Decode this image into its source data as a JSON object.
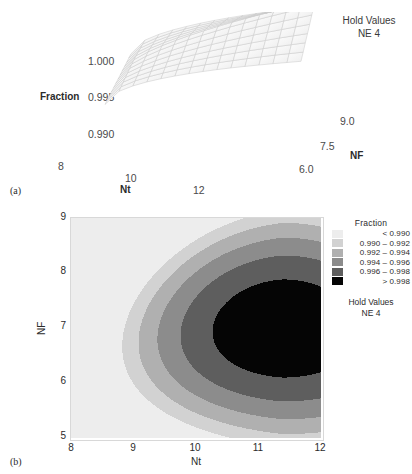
{
  "figure": {
    "panel_a_letter": "(a)",
    "panel_b_letter": "(b)"
  },
  "surface_plot": {
    "z_axis": {
      "title": "Fraction",
      "ticks": [
        "1.000",
        "0.995",
        "0.990"
      ]
    },
    "x_axis": {
      "title": "Nt",
      "ticks": [
        "8",
        "10",
        "12"
      ]
    },
    "y_axis": {
      "title": "NF",
      "ticks": [
        "9.0",
        "7.5",
        "6.0"
      ]
    },
    "hold_values": {
      "heading": "Hold Values",
      "value": "NE 4"
    }
  },
  "contour_plot": {
    "x_axis": {
      "title": "Nt",
      "ticks": [
        "8",
        "9",
        "10",
        "11",
        "12"
      ]
    },
    "y_axis": {
      "title": "NF",
      "ticks": [
        "9",
        "8",
        "7",
        "6",
        "5"
      ]
    },
    "legend": {
      "title": "Fraction",
      "entries": [
        {
          "label": "<  0.990",
          "color": "#ededed"
        },
        {
          "label": "0.990  –  0.992",
          "color": "#d2d2d2"
        },
        {
          "label": "0.992  –  0.994",
          "color": "#b0b0b0"
        },
        {
          "label": "0.994  –  0.996",
          "color": "#8c8c8c"
        },
        {
          "label": "0.996  –  0.998",
          "color": "#5e5e5e"
        },
        {
          "label": ">  0.998",
          "color": "#050505"
        }
      ]
    },
    "hold_values": {
      "heading": "Hold Values",
      "value": "NE 4"
    }
  },
  "chart_data": [
    {
      "type": "surface",
      "title": "",
      "xlabel": "Nt",
      "ylabel": "NF",
      "zlabel": "Fraction",
      "xlim": [
        8,
        13
      ],
      "ylim": [
        5.5,
        9.5
      ],
      "zlim": [
        0.9885,
        1.001
      ],
      "ztick_values": [
        0.99,
        0.995,
        1.0
      ],
      "xtick_values": [
        8,
        10,
        12
      ],
      "ytick_values": [
        6.0,
        7.5,
        9.0
      ],
      "grid": false,
      "annotations": [
        "Hold Values",
        "NE 4"
      ],
      "note": "Mesh surface of Fraction rising toward high Nt; saddle-shaped wireframe in light grey."
    },
    {
      "type": "heatmap",
      "subtype": "filled-contour",
      "title": "",
      "xlabel": "Nt",
      "ylabel": "NF",
      "xlim": [
        8,
        12
      ],
      "ylim": [
        5,
        9
      ],
      "xtick_values": [
        8,
        9,
        10,
        11,
        12
      ],
      "ytick_values": [
        5,
        6,
        7,
        8,
        9
      ],
      "grid": false,
      "legend_position": "right",
      "legend_title": "Fraction",
      "levels": [
        0.99,
        0.992,
        0.994,
        0.996,
        0.998
      ],
      "bands": [
        {
          "range": "< 0.990",
          "color": "#ededed"
        },
        {
          "range": "0.990 - 0.992",
          "color": "#d2d2d2"
        },
        {
          "range": "0.992 - 0.994",
          "color": "#b0b0b0"
        },
        {
          "range": "0.994 - 0.996",
          "color": "#8c8c8c"
        },
        {
          "range": "0.996 - 0.998",
          "color": "#5e5e5e"
        },
        {
          "range": "> 0.998",
          "color": "#050505"
        }
      ],
      "annotations": [
        "Hold Values",
        "NE 4"
      ],
      "note": "Nested crescent contours opening to the upper right; darkest (>0.998) region is a large lobe centred near Nt=11, NF=7."
    }
  ]
}
